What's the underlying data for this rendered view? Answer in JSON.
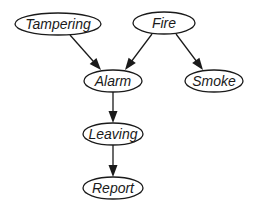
{
  "diagram": {
    "type": "bayesian-network",
    "colors": {
      "stroke": "#1a1a1a",
      "node_fill": "#ffffff",
      "background": "#ffffff"
    },
    "nodes": [
      {
        "id": "tampering",
        "label": "Tampering",
        "cx": 58,
        "cy": 24,
        "rx": 43,
        "ry": 11
      },
      {
        "id": "fire",
        "label": "Fire",
        "cx": 164,
        "cy": 23,
        "rx": 31,
        "ry": 11
      },
      {
        "id": "alarm",
        "label": "Alarm",
        "cx": 113,
        "cy": 81,
        "rx": 29,
        "ry": 11
      },
      {
        "id": "smoke",
        "label": "Smoke",
        "cx": 214,
        "cy": 81,
        "rx": 29,
        "ry": 11
      },
      {
        "id": "leaving",
        "label": "Leaving",
        "cx": 113,
        "cy": 134,
        "rx": 30,
        "ry": 11
      },
      {
        "id": "report",
        "label": "Report",
        "cx": 113,
        "cy": 188,
        "rx": 30,
        "ry": 11
      }
    ],
    "edges": [
      {
        "from": "tampering",
        "to": "alarm",
        "x1": 70,
        "y1": 35,
        "x2": 101,
        "y2": 70
      },
      {
        "from": "fire",
        "to": "alarm",
        "x1": 152,
        "y1": 34,
        "x2": 125,
        "y2": 70
      },
      {
        "from": "fire",
        "to": "smoke",
        "x1": 176,
        "y1": 34,
        "x2": 203,
        "y2": 70
      },
      {
        "from": "alarm",
        "to": "leaving",
        "x1": 113,
        "y1": 92,
        "x2": 113,
        "y2": 123
      },
      {
        "from": "leaving",
        "to": "report",
        "x1": 113,
        "y1": 145,
        "x2": 113,
        "y2": 177
      }
    ]
  }
}
